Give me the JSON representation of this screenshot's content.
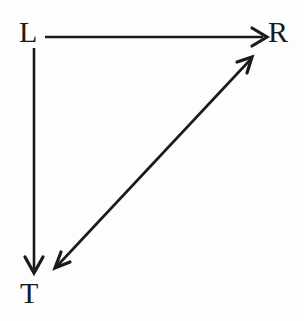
{
  "figure": {
    "kind": "arrow-diagram",
    "background_color": "#fdfdfd",
    "stroke_color": "#1a1a1a",
    "width": 304,
    "height": 321
  },
  "nodes": [
    {
      "id": "L",
      "label": "L",
      "x": 34,
      "y": 32,
      "name": "node-label-l"
    },
    {
      "id": "R",
      "label": "R",
      "x": 281,
      "y": 32,
      "name": "node-label-r"
    },
    {
      "id": "T",
      "label": "T",
      "x": 34,
      "y": 293,
      "name": "node-label-t"
    }
  ],
  "edges": [
    {
      "id": "L-to-R",
      "from": "L",
      "to": "R",
      "direction": "single",
      "orientation": "horizontal",
      "x1": 45,
      "y1": 37,
      "x2": 266,
      "y2": 37
    },
    {
      "id": "L-to-T",
      "from": "L",
      "to": "T",
      "direction": "single",
      "orientation": "vertical",
      "x1": 34,
      "y1": 48,
      "x2": 34,
      "y2": 272
    },
    {
      "id": "T-to-R-diagonal",
      "from": "T",
      "to": "R",
      "direction": "double",
      "orientation": "diagonal",
      "x1": 56,
      "y1": 267,
      "x2": 251,
      "y2": 58
    }
  ],
  "arrowheads": {
    "style": "open-v",
    "stroke_width": 3,
    "size": 13
  }
}
